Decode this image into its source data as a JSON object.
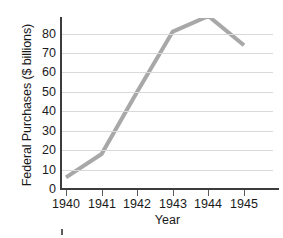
{
  "chart_data": {
    "type": "line",
    "title": "",
    "xlabel": "Year",
    "ylabel": "Federal Purchases ($ billions)",
    "categories": [
      "1940",
      "1941",
      "1942",
      "1943",
      "1944",
      "1945"
    ],
    "x": [
      1940,
      1941,
      1942,
      1943,
      1944,
      1945
    ],
    "values": [
      6,
      18,
      50,
      81,
      89,
      74
    ],
    "series": [
      {
        "name": "Federal Purchases",
        "values": [
          6,
          18,
          50,
          81,
          89,
          74
        ],
        "color": "#a8a8a8"
      }
    ],
    "xlim": [
      1940,
      1945
    ],
    "ylim": [
      0,
      88
    ],
    "ytick_labels": [
      "0",
      "10",
      "20",
      "30",
      "40",
      "50",
      "60",
      "70",
      "80"
    ],
    "ytick_values": [
      0,
      10,
      20,
      30,
      40,
      50,
      60,
      70,
      80
    ],
    "xtick_labels": [
      "1940",
      "1941",
      "1942",
      "1943",
      "1944",
      "1945"
    ],
    "grid": "horizontal",
    "legend": "none",
    "annotations": []
  },
  "style": {
    "line_color": "#a8a8a8",
    "grid_color": "#d9d9d9",
    "axis_color": "#3c3c3c",
    "text_color": "#1a1a1a",
    "background": "#ffffff"
  }
}
